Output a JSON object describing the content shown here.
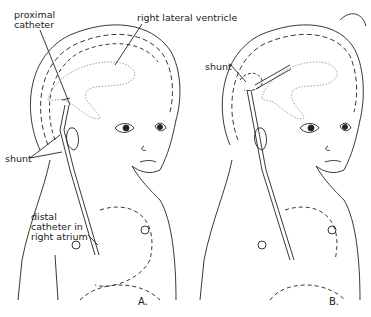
{
  "figure": {
    "panels": [
      {
        "id": "A",
        "label": "A.",
        "annotations": {
          "proximal_catheter": "proximal\ncatheter",
          "right_lateral_ventricle": "right lateral ventricle",
          "shunt": "shunt",
          "distal_catheter": "distal\ncatheter in\nright atrium"
        }
      },
      {
        "id": "B",
        "label": "B.",
        "annotations": {
          "shunt": "shunt"
        }
      }
    ],
    "colors": {
      "line": "#222222",
      "ventricle": "#999999",
      "background": "#ffffff"
    }
  }
}
